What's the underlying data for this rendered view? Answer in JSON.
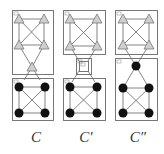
{
  "colors": {
    "box": "#777777",
    "edge": "#666666",
    "triangle_fill": "#cfcfcf",
    "triangle_stroke": "#777777",
    "circle_fill": "#111111"
  },
  "panels": [
    {
      "label": "C",
      "boxes": [
        {
          "x": 12,
          "y": 10,
          "w": 41,
          "h": 64
        },
        {
          "x": 12,
          "y": 78,
          "w": 41,
          "h": 42
        }
      ],
      "triangles": [
        [
          19,
          19
        ],
        [
          44,
          19
        ],
        [
          19,
          45
        ],
        [
          44,
          45
        ],
        [
          32,
          67
        ]
      ],
      "circles": [
        [
          19,
          87
        ],
        [
          45,
          87
        ],
        [
          19,
          113
        ],
        [
          45,
          113
        ]
      ],
      "edges": [
        [
          19,
          19,
          44,
          19
        ],
        [
          19,
          19,
          19,
          45
        ],
        [
          44,
          19,
          44,
          45
        ],
        [
          19,
          45,
          44,
          45
        ],
        [
          19,
          19,
          44,
          45
        ],
        [
          44,
          19,
          19,
          45
        ],
        [
          19,
          45,
          32,
          67
        ],
        [
          44,
          45,
          32,
          67
        ],
        [
          32,
          67,
          24,
          80
        ],
        [
          32,
          67,
          40,
          80
        ],
        [
          19,
          87,
          45,
          87
        ],
        [
          19,
          87,
          19,
          113
        ],
        [
          45,
          87,
          45,
          113
        ],
        [
          19,
          113,
          45,
          113
        ],
        [
          19,
          87,
          45,
          113
        ],
        [
          45,
          87,
          19,
          113
        ]
      ]
    },
    {
      "label": "C′",
      "boxes": [
        {
          "x": 63,
          "y": 10,
          "w": 42,
          "h": 44
        },
        {
          "x": 76,
          "y": 58,
          "w": 15,
          "h": 16
        },
        {
          "x": 79,
          "y": 61,
          "w": 9,
          "h": 10
        },
        {
          "x": 63,
          "y": 78,
          "w": 42,
          "h": 42
        }
      ],
      "triangles": [
        [
          70,
          19
        ],
        [
          97,
          19
        ],
        [
          70,
          46
        ],
        [
          97,
          46
        ]
      ],
      "circles": [
        [
          70,
          87
        ],
        [
          97,
          87
        ],
        [
          70,
          113
        ],
        [
          97,
          113
        ]
      ],
      "edges": [
        [
          70,
          19,
          97,
          19
        ],
        [
          70,
          19,
          70,
          46
        ],
        [
          97,
          19,
          97,
          46
        ],
        [
          70,
          46,
          97,
          46
        ],
        [
          70,
          19,
          97,
          46
        ],
        [
          97,
          19,
          70,
          46
        ],
        [
          70,
          46,
          79,
          61
        ],
        [
          97,
          46,
          88,
          61
        ],
        [
          79,
          71,
          72,
          82
        ],
        [
          88,
          71,
          95,
          82
        ],
        [
          70,
          87,
          97,
          87
        ],
        [
          70,
          87,
          70,
          113
        ],
        [
          97,
          87,
          97,
          113
        ],
        [
          70,
          113,
          97,
          113
        ],
        [
          70,
          87,
          97,
          113
        ],
        [
          97,
          87,
          70,
          113
        ]
      ]
    },
    {
      "label": "C″",
      "boxes": [
        {
          "x": 115,
          "y": 10,
          "w": 42,
          "h": 44
        },
        {
          "x": 115,
          "y": 58,
          "w": 42,
          "h": 62
        }
      ],
      "triangles": [
        [
          123,
          19
        ],
        [
          149,
          19
        ],
        [
          123,
          45
        ],
        [
          149,
          45
        ]
      ],
      "circles": [
        [
          136,
          66
        ],
        [
          123,
          88
        ],
        [
          149,
          88
        ],
        [
          123,
          113
        ],
        [
          149,
          113
        ]
      ],
      "edges": [
        [
          123,
          19,
          149,
          19
        ],
        [
          123,
          19,
          123,
          45
        ],
        [
          149,
          19,
          149,
          45
        ],
        [
          123,
          45,
          149,
          45
        ],
        [
          123,
          19,
          149,
          45
        ],
        [
          149,
          19,
          123,
          45
        ],
        [
          123,
          45,
          136,
          66
        ],
        [
          149,
          45,
          136,
          66
        ],
        [
          136,
          66,
          123,
          88
        ],
        [
          136,
          66,
          149,
          88
        ],
        [
          123,
          88,
          149,
          88
        ],
        [
          123,
          88,
          123,
          113
        ],
        [
          149,
          88,
          149,
          113
        ],
        [
          123,
          113,
          149,
          113
        ],
        [
          123,
          88,
          149,
          113
        ],
        [
          149,
          88,
          123,
          113
        ]
      ]
    }
  ],
  "labels": [
    {
      "text": "C",
      "x": 36
    },
    {
      "text": "C′",
      "x": 86
    },
    {
      "text": "C″",
      "x": 138
    }
  ]
}
